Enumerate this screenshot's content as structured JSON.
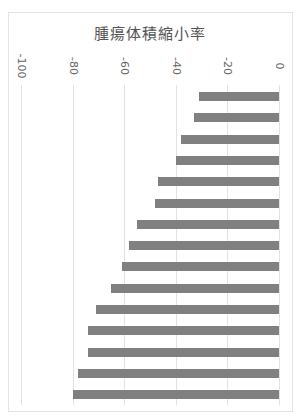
{
  "chart_data": {
    "type": "bar",
    "orientation": "horizontal",
    "title": "腫瘍体積縮小率",
    "xlabel": "",
    "ylabel": "",
    "xlim": [
      -100,
      0
    ],
    "ticks": [
      "-100",
      "-80",
      "-60",
      "-40",
      "-20",
      "0"
    ],
    "tick_values": [
      -100,
      -80,
      -60,
      -40,
      -20,
      0
    ],
    "grid": true,
    "legend": null,
    "categories": [
      "1",
      "2",
      "3",
      "4",
      "5",
      "6",
      "7",
      "8",
      "9",
      "10",
      "11",
      "12",
      "13",
      "14",
      "15"
    ],
    "values": [
      -31,
      -33,
      -38,
      -40,
      -47,
      -48,
      -55,
      -58,
      -61,
      -65,
      -71,
      -74,
      -74,
      -78,
      -80
    ],
    "bar_color": "#808080",
    "axis_label_rotation": 90
  }
}
